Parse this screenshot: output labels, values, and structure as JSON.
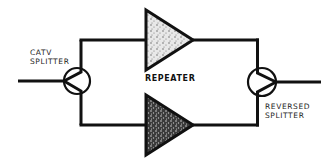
{
  "diagram": {
    "type": "block-diagram",
    "labels": {
      "catv_splitter": [
        "CATV",
        "SPLITTER"
      ],
      "repeater": "REPEATER",
      "reversed_splitter": [
        "REVERSED",
        "SPLITTER"
      ]
    },
    "nodes": [
      {
        "id": "input",
        "kind": "line"
      },
      {
        "id": "catv_splitter",
        "kind": "splitter",
        "label": "CATV SPLITTER"
      },
      {
        "id": "repeater_top",
        "kind": "amplifier"
      },
      {
        "id": "repeater_bottom",
        "kind": "amplifier"
      },
      {
        "id": "reversed_splitter",
        "kind": "splitter",
        "label": "REVERSED SPLITTER"
      },
      {
        "id": "output",
        "kind": "line"
      }
    ],
    "edges": [
      {
        "from": "input",
        "to": "catv_splitter"
      },
      {
        "from": "catv_splitter",
        "to": "repeater_top"
      },
      {
        "from": "catv_splitter",
        "to": "repeater_bottom"
      },
      {
        "from": "repeater_top",
        "to": "reversed_splitter"
      },
      {
        "from": "repeater_bottom",
        "to": "reversed_splitter"
      },
      {
        "from": "reversed_splitter",
        "to": "output"
      }
    ],
    "colors": {
      "stroke": "#111111",
      "fill_shade": "#6a6a6a",
      "background": "#ffffff"
    }
  }
}
